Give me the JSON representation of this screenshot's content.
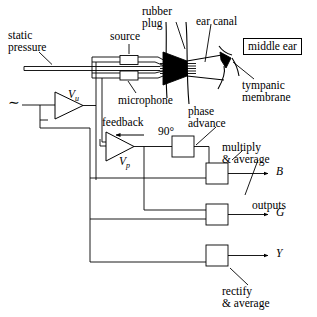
{
  "figure": {
    "stroke_color": "#000000",
    "fill_color": "#ffffff",
    "background": "#ffffff"
  },
  "labels": {
    "static_pressure": "static\npressure",
    "source": "source",
    "rubber_plug": "rubber\nplug",
    "ear_canal": "ear canal",
    "middle_ear": "middle ear",
    "tympanic_membrane": "tympanic\nmembrane",
    "microphone": "microphone",
    "feedback": "feedback",
    "phase_advance": "phase\nadvance",
    "ninety_degrees": "90°",
    "multiply_average": "multiply\n& average",
    "rectify_average": "rectify\n& average",
    "outputs": "outputs",
    "amp_u": "V",
    "amp_u_sub": "u",
    "amp_p": "V",
    "amp_p_sub": "p",
    "output_b": "B",
    "output_g": "G",
    "output_y": "Y",
    "signal_source": "∼"
  },
  "components": {
    "amplifiers": [
      {
        "name": "amplifier-vu",
        "label": "V",
        "subscript": "u"
      },
      {
        "name": "amplifier-vp",
        "label": "V",
        "subscript": "p"
      }
    ],
    "inline_boxes": [
      {
        "name": "source-transducer",
        "label": "source"
      },
      {
        "name": "microphone-transducer",
        "label": "microphone"
      }
    ],
    "processing_boxes": [
      {
        "name": "phase-advance-box",
        "label": "90°"
      },
      {
        "name": "multiply-average-box-b",
        "output": "B"
      },
      {
        "name": "multiply-average-box-g",
        "output": "G"
      },
      {
        "name": "rectify-average-box-y",
        "output": "Y"
      }
    ],
    "anatomy": [
      {
        "name": "rubber-plug"
      },
      {
        "name": "ear-canal"
      },
      {
        "name": "tympanic-membrane"
      },
      {
        "name": "middle-ear"
      }
    ]
  }
}
